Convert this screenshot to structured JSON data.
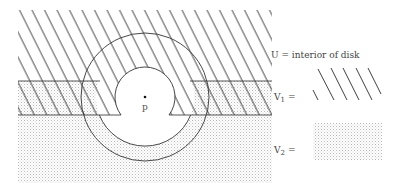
{
  "figure": {
    "point_label": "p",
    "legend": {
      "u_label": "U = interior of disk",
      "v1_label": "V",
      "v1_sub": "1",
      "v1_eq": "=",
      "v2_label": "V",
      "v2_sub": "2",
      "v2_eq": "="
    },
    "colors": {
      "line": "#333333",
      "hatch": "#2a2a2a",
      "stipple": "#bdbdbd",
      "background": "#ffffff"
    }
  }
}
